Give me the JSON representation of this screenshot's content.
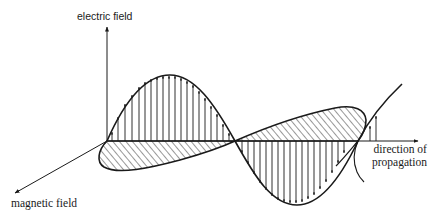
{
  "diagram": {
    "type": "electromagnetic-wave",
    "labels": {
      "electric_field": "electric field",
      "magnetic_field": "magnetic field",
      "direction_line1": "direction of",
      "direction_line2": "propagation"
    },
    "colors": {
      "ink": "#1a1a1a",
      "background": "#ffffff"
    },
    "elements": [
      "electric-field-axis",
      "magnetic-field-axis",
      "propagation-axis",
      "electric-field-wave-with-vertical-arrows",
      "magnetic-field-wave-hatched"
    ]
  }
}
